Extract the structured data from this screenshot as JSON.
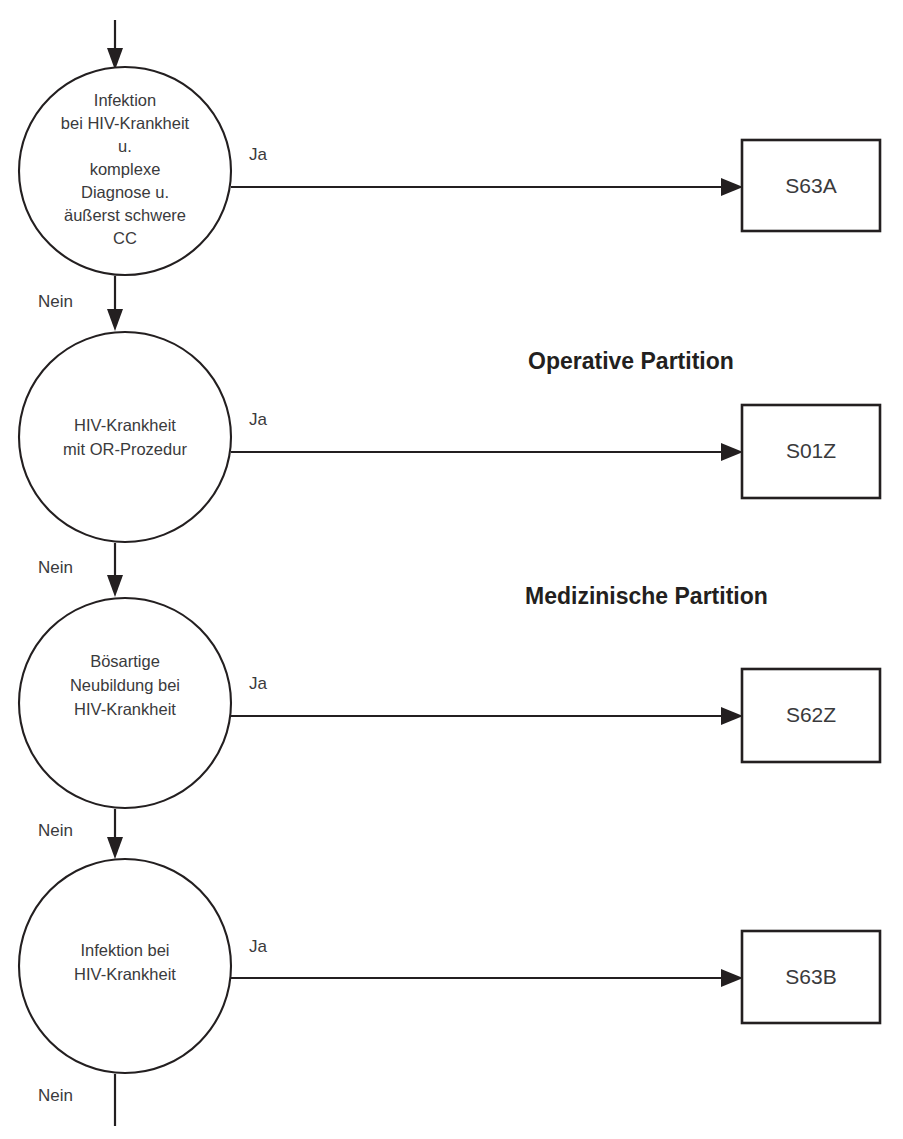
{
  "diagram": {
    "colors": {
      "stroke": "#231f20",
      "text": "#3a3a3c",
      "background": "#ffffff"
    },
    "partitions": [
      {
        "id": "operative",
        "label": "Operative Partition"
      },
      {
        "id": "medizinische",
        "label": "Medizinische Partition"
      }
    ],
    "edge_labels": {
      "yes": "Ja",
      "no": "Nein"
    },
    "nodes": [
      {
        "id": "node-1",
        "lines": [
          "Infektion",
          "bei HIV-Krankheit",
          "u.",
          "komplexe",
          "Diagnose u.",
          "äußerst schwere",
          "CC"
        ],
        "yes_label": "Ja",
        "no_label": "Nein",
        "target": "S63A"
      },
      {
        "id": "node-2",
        "lines": [
          "HIV-Krankheit",
          "mit OR-Prozedur"
        ],
        "yes_label": "Ja",
        "no_label": "Nein",
        "target": "S01Z"
      },
      {
        "id": "node-3",
        "lines": [
          "Bösartige",
          "Neubildung bei",
          "HIV-Krankheit"
        ],
        "yes_label": "Ja",
        "no_label": "Nein",
        "target": "S62Z"
      },
      {
        "id": "node-4",
        "lines": [
          "Infektion bei",
          "HIV-Krankheit"
        ],
        "yes_label": "Ja",
        "no_label": "Nein",
        "target": "S63B"
      }
    ],
    "terminals": [
      {
        "id": "box-1",
        "label": "S63A"
      },
      {
        "id": "box-2",
        "label": "S01Z"
      },
      {
        "id": "box-3",
        "label": "S62Z"
      },
      {
        "id": "box-4",
        "label": "S63B"
      }
    ]
  }
}
